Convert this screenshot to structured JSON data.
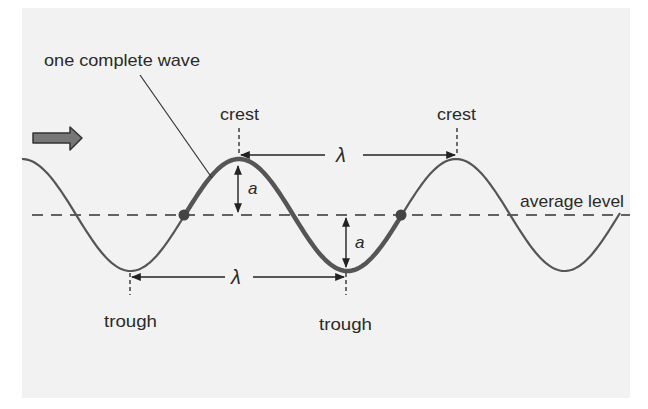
{
  "diagram": {
    "type": "transverse-wave",
    "labels": {
      "one_complete_wave": "one complete wave",
      "crest_1": "crest",
      "crest_2": "crest",
      "trough_1": "trough",
      "trough_2": "trough",
      "average_level": "average level",
      "wavelength_top": "λ",
      "wavelength_bottom": "λ",
      "amplitude_top": "a",
      "amplitude_bottom": "a"
    },
    "colors": {
      "background": "#f2f2f2",
      "wave": "#555555",
      "text": "#2a2a2a",
      "arrow_fill": "#777777"
    },
    "direction": "right",
    "geometry": {
      "average_level_y": 215,
      "amplitude_px": 56,
      "wavelength_px": 217,
      "crests_x": [
        239,
        457
      ],
      "troughs_x": [
        130,
        346
      ],
      "highlight_start_x": 184,
      "highlight_end_x": 401
    }
  }
}
